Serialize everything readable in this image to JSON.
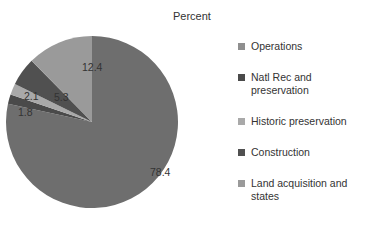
{
  "chart_data": {
    "type": "pie",
    "title": "Percent",
    "categories": [
      "Operations",
      "Natl Rec and preservation",
      "Historic preservation",
      "Construction",
      "Land acquisition and states"
    ],
    "values": [
      78.4,
      1.8,
      2.1,
      5.3,
      12.4
    ],
    "slice_order_clockwise_from_top": [
      "Operations",
      "Natl Rec and preservation",
      "Historic preservation",
      "Construction",
      "Land acquisition and states"
    ],
    "colors": [
      "#6e6e6e",
      "#4a4a4a",
      "#a9a9a9",
      "#505050",
      "#9a9a9a"
    ],
    "legend_position": "right",
    "data_labels": [
      "78.4",
      "1.8",
      "2.1",
      "5.3",
      "12.4"
    ]
  },
  "title": "Percent",
  "legend": [
    {
      "label": "Operations",
      "color": "#8f8f8f"
    },
    {
      "label": "Natl Rec and preservation",
      "color": "#4a4a4a"
    },
    {
      "label": "Historic preservation",
      "color": "#a9a9a9"
    },
    {
      "label": "Construction",
      "color": "#505050"
    },
    {
      "label": "Land acquisition and states",
      "color": "#9a9a9a"
    }
  ]
}
